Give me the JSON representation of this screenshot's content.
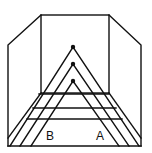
{
  "diagram": {
    "type": "perspective-illusion",
    "colors": {
      "stroke": "#111111",
      "background": "#ffffff"
    },
    "room": {
      "back_wall": {
        "x1": 41,
        "y1": 15,
        "x2": 109,
        "y2": 93
      },
      "left_wall_outer_x": 8,
      "right_wall_outer_x": 141,
      "side_wall_top_y": 45,
      "floor_y": 146
    },
    "triangles": [
      {
        "name": "outer",
        "apex": [
          73,
          47
        ],
        "left": [
          10,
          146
        ],
        "right": [
          139,
          146
        ]
      },
      {
        "name": "middle",
        "apex": [
          73,
          64
        ],
        "left": [
          20,
          146
        ],
        "right": [
          129,
          146
        ]
      },
      {
        "name": "inner",
        "apex": [
          73,
          81
        ],
        "left": [
          31,
          146
        ],
        "right": [
          119,
          146
        ]
      }
    ],
    "rungs": [
      {
        "y": 94,
        "x1": 39,
        "x2": 109
      },
      {
        "y": 108,
        "x1": 33,
        "x2": 116
      },
      {
        "y": 119,
        "x1": 27,
        "x2": 122
      }
    ],
    "labels": [
      {
        "text": "B",
        "x": 46,
        "y": 130
      },
      {
        "text": "A",
        "x": 96,
        "y": 130
      }
    ]
  }
}
